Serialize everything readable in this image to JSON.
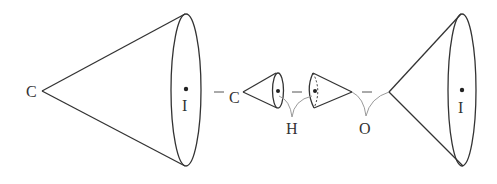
{
  "diagram": {
    "colors": {
      "stroke": "#333333",
      "bond_curve": "#9a9a9a",
      "background": "#ffffff"
    },
    "labels": {
      "left_cone_apex": "C",
      "left_cone_center": "I",
      "small_cone1_apex": "C",
      "hydrogen": "H",
      "oxygen": "O",
      "right_cone_center": "I"
    },
    "connectors": [
      "–",
      "–",
      "–"
    ]
  }
}
